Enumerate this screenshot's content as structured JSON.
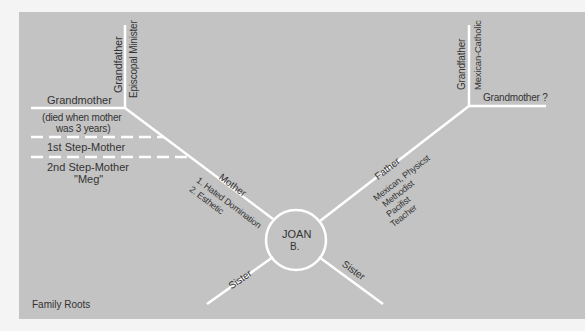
{
  "caption": "Family Roots",
  "center": {
    "line1": "JOAN",
    "line2": "B."
  },
  "maternal": {
    "grandfather": "Grandfather",
    "grandfather_note": "Episcopal Minister",
    "grandmother": "Grandmother",
    "grandmother_note_1": "(died when mother",
    "grandmother_note_2": "was 3 years)",
    "step_mother_1": "1st Step-Mother",
    "step_mother_2": "2nd Step-Mother",
    "step_mother_2_name": "\"Meg\"",
    "mother": "Mother",
    "mother_note_1": "1. Hated Domination",
    "mother_note_2": "2. Esthetic"
  },
  "paternal": {
    "grandfather": "Grandfather",
    "grandfather_note": "Mexican-Catholic",
    "grandmother": "Grandmother ?",
    "father": "Father",
    "father_notes": [
      "Mexican, Physicst",
      "Methodist",
      "Pacifist",
      "Teacher"
    ]
  },
  "siblings": {
    "left": "Sister",
    "right": "Sister"
  },
  "colors": {
    "background": "#c3c3c3",
    "lines": "#ffffff",
    "text": "#333333"
  }
}
